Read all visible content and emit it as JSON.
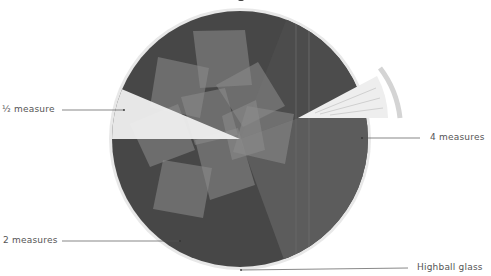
{
  "diagram": {
    "type": "cocktail-glass-top-view",
    "colors": {
      "background": "#ffffff",
      "glass_rim": "#e6e6e6",
      "liquid_dark": "#484848",
      "liquid_mid": "#5e5e5e",
      "ice": "#8a8a8a",
      "wedge_light": "#ededed",
      "label_text": "#555555",
      "leader_line": "#444444"
    },
    "labels": {
      "half_measure": "½ measure",
      "four_measures": "4 measures",
      "two_measures": "2 measures",
      "glass": "Highball glass"
    }
  }
}
